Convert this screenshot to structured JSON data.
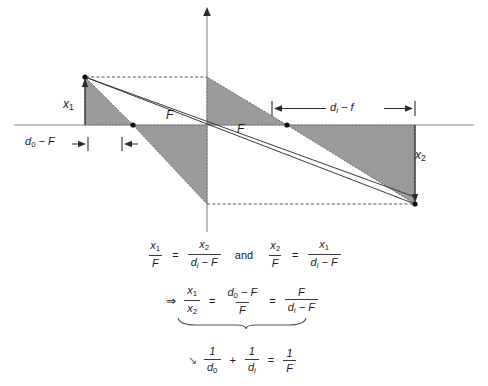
{
  "figure": {
    "axis": {
      "horizontal_label": "optical axis",
      "vertical_label": "lens plane"
    },
    "labels": {
      "object_height": "x",
      "object_height_sub": "1",
      "image_height": "x",
      "image_height_sub": "2",
      "focal_left": "F",
      "focal_right": "F",
      "dim_left_main": "d",
      "dim_left_sub": "0",
      "dim_left_tail": " − F",
      "dim_right_main": "d",
      "dim_right_sub": "i",
      "dim_right_tail": " − f"
    },
    "colors": {
      "shade": "#9a9a9a",
      "shade_stroke": "#555555",
      "line": "#3a3a3a",
      "axis": "#777777",
      "dot": "#1a1a1a",
      "dash": "#666666",
      "background": "#ffffff"
    }
  },
  "equations": {
    "row1": {
      "frac1": {
        "num": "x",
        "num_sub": "1",
        "den": "F"
      },
      "equals1": "=",
      "frac2": {
        "num": "x",
        "num_sub": "2",
        "den": "d",
        "den_sub": "i",
        "den_tail": " − F"
      },
      "connector": "and",
      "frac3": {
        "num": "x",
        "num_sub": "2",
        "den": "F"
      },
      "equals2": "=",
      "frac4": {
        "num": "x",
        "num_sub": "1",
        "den": "d",
        "den_sub": "i",
        "den_tail": " − F"
      }
    },
    "row2": {
      "implies": "⇒",
      "frac1": {
        "num": "x",
        "num_sub": "1",
        "den": "x",
        "den_sub": "2"
      },
      "equals1": "=",
      "frac2": {
        "num": "d",
        "num_sub": "0",
        "num_tail": " − F",
        "den": "F"
      },
      "equals2": "=",
      "frac3": {
        "num": "F",
        "den": "d",
        "den_sub": "i",
        "den_tail": " − F"
      }
    },
    "row3": {
      "arrow": "↘",
      "frac1": {
        "num": "1",
        "den": "d",
        "den_sub": "0"
      },
      "plus": "+",
      "frac2": {
        "num": "1",
        "den": "d",
        "den_sub": "i"
      },
      "equals": "=",
      "frac3": {
        "num": "1",
        "den": "F"
      }
    }
  }
}
